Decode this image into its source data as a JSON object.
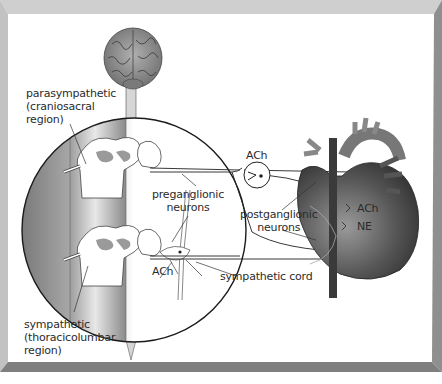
{
  "diagram": {
    "type": "autonomic nervous system anatomy",
    "labels": {
      "parasympathetic": [
        "parasympathetic",
        "(craniosacral",
        "region)"
      ],
      "sympathetic": [
        "sympathetic",
        "(thoracicolumbar",
        "region)"
      ],
      "preganglionic": [
        "preganglionic",
        "neurons"
      ],
      "postganglionic": [
        "postganglionic",
        "neurons"
      ],
      "ach_synapse": "ACh",
      "ach_cord": "ACh",
      "sympathetic_cord": "sympathetic cord",
      "heart_ach": "ACh",
      "heart_ne": "NE"
    },
    "structures": [
      "brain",
      "spinal cord",
      "magnified spinal cord section",
      "ganglion",
      "heart"
    ],
    "colors": {
      "frame": "#9a9a9a",
      "frame_light": "#c8c8c8",
      "lines": "#222222",
      "heart": "#4a4a4a",
      "brain": "#8c8c8c"
    }
  }
}
